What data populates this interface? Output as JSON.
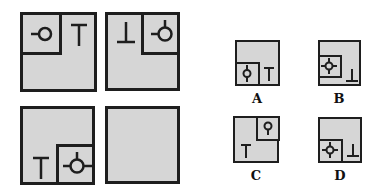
{
  "puzzle": {
    "matrix": [
      {
        "id": "cell-1",
        "inner_corner": "top-left",
        "inner_symbol": "circle-stem-left",
        "outer_symbol": "T"
      },
      {
        "id": "cell-2",
        "inner_corner": "top-right",
        "inner_symbol": "circle-stem-left-top",
        "outer_symbol": "inverted-T"
      },
      {
        "id": "cell-3",
        "inner_corner": "bottom-right",
        "inner_symbol": "circle-stem-left-top-right",
        "outer_symbol": "T"
      },
      {
        "id": "cell-4",
        "inner_corner": "none",
        "inner_symbol": "",
        "outer_symbol": "",
        "blank": true
      }
    ],
    "options": [
      {
        "label": "A",
        "inner_corner": "bottom-left",
        "inner_symbol": "circle-stem-top-bottom",
        "outer_symbol": "T"
      },
      {
        "label": "B",
        "inner_corner": "left-middle",
        "inner_symbol": "circle-stem-all-four",
        "outer_symbol": "inverted-T"
      },
      {
        "label": "C",
        "inner_corner": "top-right",
        "inner_symbol": "circle-stem-bottom",
        "outer_symbol": "T"
      },
      {
        "label": "D",
        "inner_corner": "bottom-left",
        "inner_symbol": "circle-stem-all-four",
        "outer_symbol": "inverted-T"
      }
    ],
    "colors": {
      "fill": "#d6d6d6",
      "stroke": "#1e1e1e",
      "background": "#ffffff"
    }
  }
}
